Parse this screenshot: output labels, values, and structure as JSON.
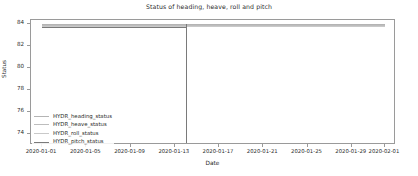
{
  "chart_data": {
    "type": "line",
    "title": "Status of heading, heave, roll and pitch",
    "xlabel": "Date",
    "ylabel": "Status",
    "grid": false,
    "legend_position": "lower left",
    "xlim": [
      "2019-12-31",
      "2020-02-02"
    ],
    "ylim": [
      73.0,
      84.4
    ],
    "yticks": [
      84,
      82,
      80,
      78,
      76,
      74
    ],
    "ytick_labels": [
      "84",
      "82",
      "80",
      "78",
      "76",
      "74"
    ],
    "xticks": [
      "2020-01-01",
      "2020-01-05",
      "2020-01-09",
      "2020-01-13",
      "2020-01-17",
      "2020-01-21",
      "2020-01-25",
      "2020-01-29",
      "2020-02-01"
    ],
    "xtick_labels": [
      "2020-01-01",
      "2020-01-05",
      "2020-01-09",
      "2020-01-13",
      "2020-01-17",
      "2020-01-21",
      "2020-01-25",
      "2020-01-29",
      "2020-02-01"
    ],
    "series": [
      {
        "name": "HYDR_heading_status",
        "color": "#b4b4b4",
        "x": [
          "2020-01-01",
          "2020-02-01"
        ],
        "values": [
          84,
          84
        ]
      },
      {
        "name": "HYDR_heave_status",
        "color": "#bdbdbd",
        "x": [
          "2020-01-01",
          "2020-02-01"
        ],
        "values": [
          84,
          84
        ]
      },
      {
        "name": "HYDR_roll_status",
        "color": "#c9c9c9",
        "x": [
          "2020-01-01",
          "2020-02-01"
        ],
        "values": [
          84,
          84
        ]
      },
      {
        "name": "HYDR_pitch_status",
        "color": "#7a7a7a",
        "x": [
          "2020-01-01",
          "2020-01-14",
          "2020-01-14",
          "2020-02-01"
        ],
        "values": [
          84,
          84,
          73.2,
          84
        ],
        "note": "drops to 73.2 at 2020-01-14 then returns"
      }
    ],
    "annotations": [
      {
        "type": "vertical-drop",
        "x": "2020-01-14",
        "y_from": 84,
        "y_to": 73.2,
        "color": "#7a7a7a"
      }
    ]
  },
  "legend": {
    "items": [
      {
        "label": "HYDR_heading_status",
        "color": "#b4b4b4"
      },
      {
        "label": "HYDR_heave_status",
        "color": "#bdbdbd"
      },
      {
        "label": "HYDR_roll_status",
        "color": "#c9c9c9"
      },
      {
        "label": "HYDR_pitch_status",
        "color": "#7a7a7a"
      }
    ]
  }
}
